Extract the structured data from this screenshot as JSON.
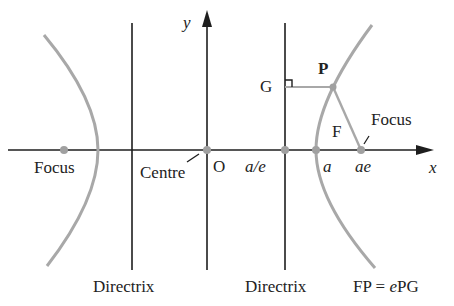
{
  "figure": {
    "colors": {
      "ink": "#1e1e1e",
      "curve": "#a8a8a8",
      "point": "#a0a0a0",
      "background": "#ffffff"
    },
    "axes": {
      "x_label": "x",
      "y_label": "y"
    },
    "points": {
      "origin": "O",
      "a_over_e": "a/e",
      "a": "a",
      "ae": "ae",
      "P": "P",
      "G": "G",
      "F": "F"
    },
    "labels": {
      "focus_left": "Focus",
      "focus_right": "Focus",
      "centre": "Centre",
      "directrix_left": "Directrix",
      "directrix_right": "Directrix",
      "relation_fp": "FP = ",
      "relation_e": "e",
      "relation_pg": "PG"
    }
  }
}
